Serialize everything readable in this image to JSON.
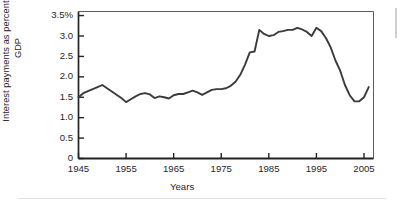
{
  "figure": {
    "name": "interest-payments-gdp-line-chart",
    "line_color": "#3a3a3f",
    "axis_color": "#232327",
    "background": "#ffffff"
  },
  "chart_data": {
    "type": "line",
    "title": "",
    "xlabel": "Years",
    "ylabel": "Interest payments as percentage of GDP",
    "xlim": [
      1945,
      2007
    ],
    "ylim": [
      0,
      3.6
    ],
    "grid": false,
    "legend": null,
    "xticks": [
      1945,
      1955,
      1965,
      1975,
      1985,
      1995,
      2005
    ],
    "xtick_labels": [
      "1945",
      "1955",
      "1965",
      "1975",
      "1985",
      "1995",
      "2005"
    ],
    "yticks": [
      0,
      0.5,
      1.0,
      1.5,
      2.0,
      2.5,
      3.0,
      3.5
    ],
    "ytick_labels": [
      "0",
      "0.5",
      "1.0",
      "1.5",
      "2.0",
      "2.5",
      "3.0",
      "3.5%"
    ],
    "series": [
      {
        "name": "Interest payments as percentage of GDP",
        "x": [
          1945,
          1946,
          1947,
          1948,
          1949,
          1950,
          1951,
          1952,
          1953,
          1954,
          1955,
          1956,
          1957,
          1958,
          1959,
          1960,
          1961,
          1962,
          1963,
          1964,
          1965,
          1966,
          1967,
          1968,
          1969,
          1970,
          1971,
          1972,
          1973,
          1974,
          1975,
          1976,
          1977,
          1978,
          1979,
          1980,
          1981,
          1982,
          1983,
          1984,
          1985,
          1986,
          1987,
          1988,
          1989,
          1990,
          1991,
          1992,
          1993,
          1994,
          1995,
          1996,
          1997,
          1998,
          1999,
          2000,
          2001,
          2002,
          2003,
          2004,
          2005,
          2006
        ],
        "values": [
          1.5,
          1.6,
          1.65,
          1.7,
          1.75,
          1.8,
          1.72,
          1.64,
          1.56,
          1.48,
          1.38,
          1.45,
          1.52,
          1.58,
          1.6,
          1.57,
          1.48,
          1.52,
          1.5,
          1.47,
          1.55,
          1.58,
          1.58,
          1.62,
          1.66,
          1.62,
          1.56,
          1.62,
          1.68,
          1.7,
          1.7,
          1.72,
          1.78,
          1.88,
          2.05,
          2.3,
          2.6,
          2.62,
          3.15,
          3.05,
          3.0,
          3.02,
          3.1,
          3.12,
          3.15,
          3.15,
          3.2,
          3.16,
          3.1,
          3.0,
          3.2,
          3.12,
          2.95,
          2.72,
          2.4,
          2.15,
          1.8,
          1.55,
          1.4,
          1.4,
          1.5,
          1.75
        ]
      }
    ],
    "annotations": []
  }
}
